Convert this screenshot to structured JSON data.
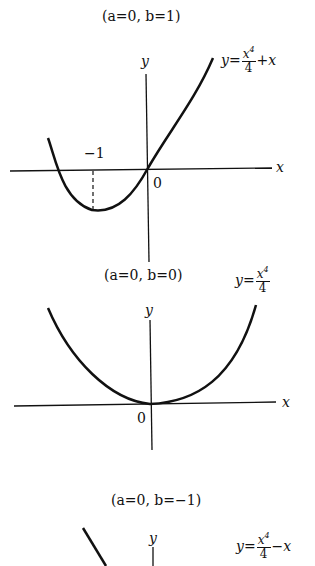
{
  "panels": [
    {
      "title": "(a=0, b=1)",
      "equation": {
        "lhs": "y",
        "num_base": "x",
        "num_exp": "4",
        "den": "4",
        "tail": "+x"
      },
      "axis_x_label": "x",
      "axis_y_label": "y",
      "origin_label": "0",
      "tick_label": "−1"
    },
    {
      "title": "(a=0, b=0)",
      "equation": {
        "lhs": "y",
        "num_base": "x",
        "num_exp": "4",
        "den": "4",
        "tail": ""
      },
      "axis_x_label": "x",
      "axis_y_label": "y",
      "origin_label": "0"
    },
    {
      "title": "(a=0, b=−1)",
      "equation": {
        "lhs": "y",
        "num_base": "x",
        "num_exp": "4",
        "den": "4",
        "tail": "−x"
      },
      "axis_y_label": "y"
    }
  ],
  "colors": {
    "ink": "#111111",
    "background": "#ffffff"
  }
}
